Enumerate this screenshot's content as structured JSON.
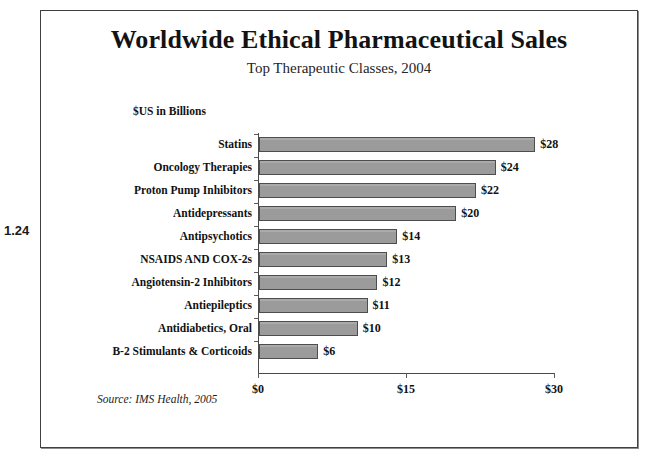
{
  "figure_number": "1.24",
  "chart": {
    "title": "Worldwide Ethical Pharmaceutical Sales",
    "subtitle": "Top Therapeutic Classes, 2004",
    "units_label": "$US in Billions",
    "source_note": "Source: IMS Health, 2005"
  },
  "colors": {
    "bar_fill": "#9b9b9b",
    "bar_border": "#4d4d4d",
    "axis": "#4a4a4a",
    "frame": "#404040",
    "text": "#111111",
    "background": "#ffffff"
  },
  "chart_data": {
    "type": "bar",
    "orientation": "horizontal",
    "title": "Worldwide Ethical Pharmaceutical Sales",
    "subtitle": "Top Therapeutic Classes, 2004",
    "xlabel": "$US in Billions",
    "ylabel": "",
    "xlim": [
      0,
      30
    ],
    "xticks": [
      0,
      15,
      30
    ],
    "xtick_labels": [
      "$0",
      "$15",
      "$30"
    ],
    "grid": false,
    "legend": false,
    "source": "Source: IMS Health, 2005",
    "categories": [
      "Statins",
      "Oncology Therapies",
      "Proton Pump Inhibitors",
      "Antidepressants",
      "Antipsychotics",
      "NSAIDS AND COX-2s",
      "Angiotensin-2 Inhibitors",
      "Antiepileptics",
      "Antidiabetics, Oral",
      "B-2 Stimulants & Corticoids"
    ],
    "values": [
      28,
      24,
      22,
      20,
      14,
      13,
      12,
      11,
      10,
      6
    ],
    "data_labels": [
      "$28",
      "$24",
      "$22",
      "$20",
      "$14",
      "$13",
      "$12",
      "$11",
      "$10",
      "$6"
    ]
  }
}
